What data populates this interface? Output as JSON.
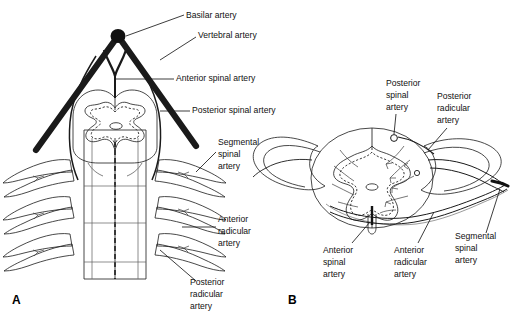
{
  "figure": {
    "background_color": "#ffffff",
    "panels": [
      {
        "letter": "A",
        "view": "anterior-view-of-spinal-cord-arterial-supply"
      },
      {
        "letter": "B",
        "view": "transverse-cross-section-of-spinal-cord-arterial-supply"
      }
    ]
  },
  "colors": {
    "white_matter": "#8e8e8e",
    "gray_matter": "#b4b4b4",
    "artery_dark": "#1a1a1a",
    "dura_sleeve": "#d3d3d3",
    "nerve_root": "#8a8a8a",
    "central_canal": "#ffffff",
    "text": "#111111",
    "outline": "#1a1a1a"
  },
  "panel_a": {
    "letter": "A",
    "labels": [
      {
        "id": "basilar-artery",
        "text": "Basilar artery",
        "x": 186,
        "y": 18
      },
      {
        "id": "vertebral-artery",
        "text": "Vertebral artery",
        "x": 198,
        "y": 38
      },
      {
        "id": "anterior-spinal-artery",
        "text": "Anterior spinal artery",
        "x": 176,
        "y": 81
      },
      {
        "id": "posterior-spinal-artery",
        "text": "Posterior spinal artery",
        "x": 192,
        "y": 113
      },
      {
        "id": "segmental-spinal-artery",
        "lines": [
          "Segmental",
          "spinal",
          "artery"
        ],
        "x": 218,
        "y": 145
      },
      {
        "id": "anterior-radicular-artery",
        "lines": [
          "Anterior",
          "radicular",
          "artery"
        ],
        "x": 218,
        "y": 222
      },
      {
        "id": "posterior-radicular-artery",
        "lines": [
          "Posterior",
          "radicular",
          "artery"
        ],
        "x": 190,
        "y": 285
      }
    ]
  },
  "panel_b": {
    "letter": "B",
    "labels": [
      {
        "id": "posterior-spinal-artery",
        "lines": [
          "Posterior",
          "spinal",
          "artery"
        ],
        "x": 386,
        "y": 86
      },
      {
        "id": "posterior-radicular-artery",
        "lines": [
          "Posterior",
          "radicular",
          "artery"
        ],
        "x": 437,
        "y": 99
      },
      {
        "id": "segmental-spinal-artery",
        "lines": [
          "Segmental",
          "spinal",
          "artery"
        ],
        "x": 455,
        "y": 239
      },
      {
        "id": "anterior-spinal-artery",
        "lines": [
          "Anterior",
          "spinal",
          "artery"
        ],
        "x": 323,
        "y": 253
      },
      {
        "id": "anterior-radicular-artery",
        "lines": [
          "Anterior",
          "radicular",
          "artery"
        ],
        "x": 394,
        "y": 253
      }
    ]
  }
}
